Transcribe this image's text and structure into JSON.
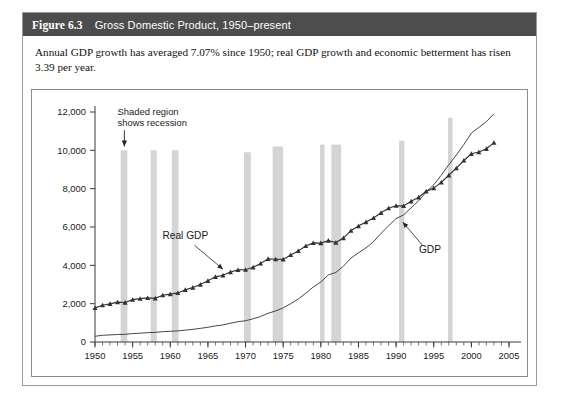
{
  "figure": {
    "number": "Figure 6.3",
    "title": "Gross Domestic Product, 1950–present",
    "caption": "Annual GDP growth has averaged 7.07% since 1950; real GDP growth and economic betterment has risen 3.39 per year.",
    "header_bg": "#4d4d4d",
    "header_fg": "#ffffff",
    "border_color": "#9a9a9a"
  },
  "chart_data": {
    "type": "line",
    "title": "Gross Domestic Product, 1950–present",
    "xlabel": "",
    "ylabel": "",
    "xlim": [
      1950,
      2005
    ],
    "ylim": [
      0,
      12000
    ],
    "xticks": [
      1950,
      1955,
      1960,
      1965,
      1970,
      1975,
      1980,
      1985,
      1990,
      1995,
      2000,
      2005
    ],
    "xtick_labels": [
      "1950",
      "1955",
      "1960",
      "1965",
      "1970",
      "1975",
      "1980",
      "1985",
      "1990",
      "1995",
      "2000",
      "2005"
    ],
    "yticks": [
      0,
      2000,
      4000,
      6000,
      8000,
      10000,
      12000
    ],
    "ytick_labels": [
      "0",
      "2,000",
      "4,000",
      "6,000",
      "8,000",
      "10,000",
      "12,000"
    ],
    "grid": false,
    "legend": "inline-annotations",
    "minor_xticks_interval": 1,
    "series": [
      {
        "name": "Real GDP",
        "marker": "triangle",
        "color": "#333333",
        "label_position": {
          "x": 1962.0,
          "y": 5350
        },
        "x": [
          1950,
          1951,
          1952,
          1953,
          1954,
          1955,
          1956,
          1957,
          1958,
          1959,
          1960,
          1961,
          1962,
          1963,
          1964,
          1965,
          1966,
          1967,
          1968,
          1969,
          1970,
          1971,
          1972,
          1973,
          1974,
          1975,
          1976,
          1977,
          1978,
          1979,
          1980,
          1981,
          1982,
          1983,
          1984,
          1985,
          1986,
          1987,
          1988,
          1989,
          1990,
          1991,
          1992,
          1993,
          1994,
          1995,
          1996,
          1997,
          1998,
          1999,
          2000,
          2001,
          2002,
          2003
        ],
        "y": [
          1780,
          1920,
          1990,
          2080,
          2060,
          2210,
          2260,
          2300,
          2280,
          2440,
          2500,
          2560,
          2720,
          2840,
          3000,
          3190,
          3400,
          3480,
          3650,
          3760,
          3770,
          3900,
          4100,
          4340,
          4320,
          4310,
          4540,
          4750,
          5010,
          5170,
          5160,
          5290,
          5190,
          5420,
          5810,
          6050,
          6260,
          6470,
          6740,
          6980,
          7110,
          7100,
          7340,
          7550,
          7860,
          8030,
          8330,
          8700,
          9070,
          9470,
          9820,
          9910,
          10080,
          10400
        ]
      },
      {
        "name": "GDP",
        "marker": "none",
        "color": "#333333",
        "label_position": {
          "x": 1994.5,
          "y": 4650
        },
        "x": [
          1950,
          1951,
          1952,
          1953,
          1954,
          1955,
          1956,
          1957,
          1958,
          1959,
          1960,
          1961,
          1962,
          1963,
          1964,
          1965,
          1966,
          1967,
          1968,
          1969,
          1970,
          1971,
          1972,
          1973,
          1974,
          1975,
          1976,
          1977,
          1978,
          1979,
          1980,
          1981,
          1982,
          1983,
          1984,
          1985,
          1986,
          1987,
          1988,
          1989,
          1990,
          1991,
          1992,
          1993,
          1994,
          1995,
          1996,
          1997,
          1998,
          1999,
          2000,
          2001,
          2002,
          2003
        ],
        "y": [
          300,
          350,
          370,
          390,
          400,
          440,
          460,
          490,
          500,
          540,
          560,
          580,
          620,
          660,
          710,
          770,
          840,
          890,
          980,
          1060,
          1110,
          1210,
          1330,
          1500,
          1620,
          1780,
          2000,
          2240,
          2540,
          2870,
          3130,
          3500,
          3630,
          3950,
          4380,
          4650,
          4910,
          5230,
          5670,
          6060,
          6440,
          6630,
          7000,
          7370,
          7830,
          8200,
          8700,
          9250,
          9750,
          10300,
          10900,
          11200,
          11500,
          11900
        ]
      }
    ],
    "recession_bands": [
      {
        "start": 1953.4,
        "end": 1954.3,
        "top": 10000
      },
      {
        "start": 1957.4,
        "end": 1958.2,
        "top": 10000
      },
      {
        "start": 1960.2,
        "end": 1961.1,
        "top": 10000
      },
      {
        "start": 1969.8,
        "end": 1970.7,
        "top": 9900
      },
      {
        "start": 1973.6,
        "end": 1975.0,
        "top": 10200
      },
      {
        "start": 1979.9,
        "end": 1980.5,
        "top": 10300
      },
      {
        "start": 1981.4,
        "end": 1982.7,
        "top": 10300
      },
      {
        "start": 1990.4,
        "end": 1991.1,
        "top": 10500
      },
      {
        "start": 1996.9,
        "end": 1997.3,
        "top": 11700
      }
    ],
    "band_color": "#d4d4d4",
    "annotations": [
      {
        "name": "recession-note",
        "text_lines": [
          "Shaded region",
          "shows recession"
        ],
        "text_x": 1953.0,
        "text_y": 11850,
        "arrow_from": {
          "x": 1953.9,
          "y": 11050
        },
        "arrow_to": {
          "x": 1953.9,
          "y": 10200
        }
      }
    ]
  }
}
